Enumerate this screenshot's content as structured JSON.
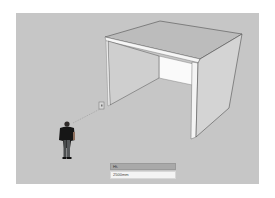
{
  "app": {
    "type": "3d-modeling-viewport"
  },
  "viewport": {
    "background_color": "#c6c6c6",
    "objects": [
      {
        "name": "open-box-model",
        "description": "Open-sided box with top slab, left and right side panels, and back wall"
      },
      {
        "name": "scale-figure",
        "description": "Standing person scale figure"
      },
      {
        "name": "inference-guide",
        "description": "Dotted line from figure to box corner"
      },
      {
        "name": "cursor-marker",
        "description": "Small rectangle cursor at box front-left base corner"
      }
    ]
  },
  "measurements": {
    "label": "Ht.",
    "value": "2500mm"
  },
  "colors": {
    "top_face": "#bdbdbd",
    "side_face": "#d2d2d2",
    "back_wall": "#f8f8f8",
    "edge": "#4a4a4a",
    "front_edge_highlight": "#ffffff"
  }
}
